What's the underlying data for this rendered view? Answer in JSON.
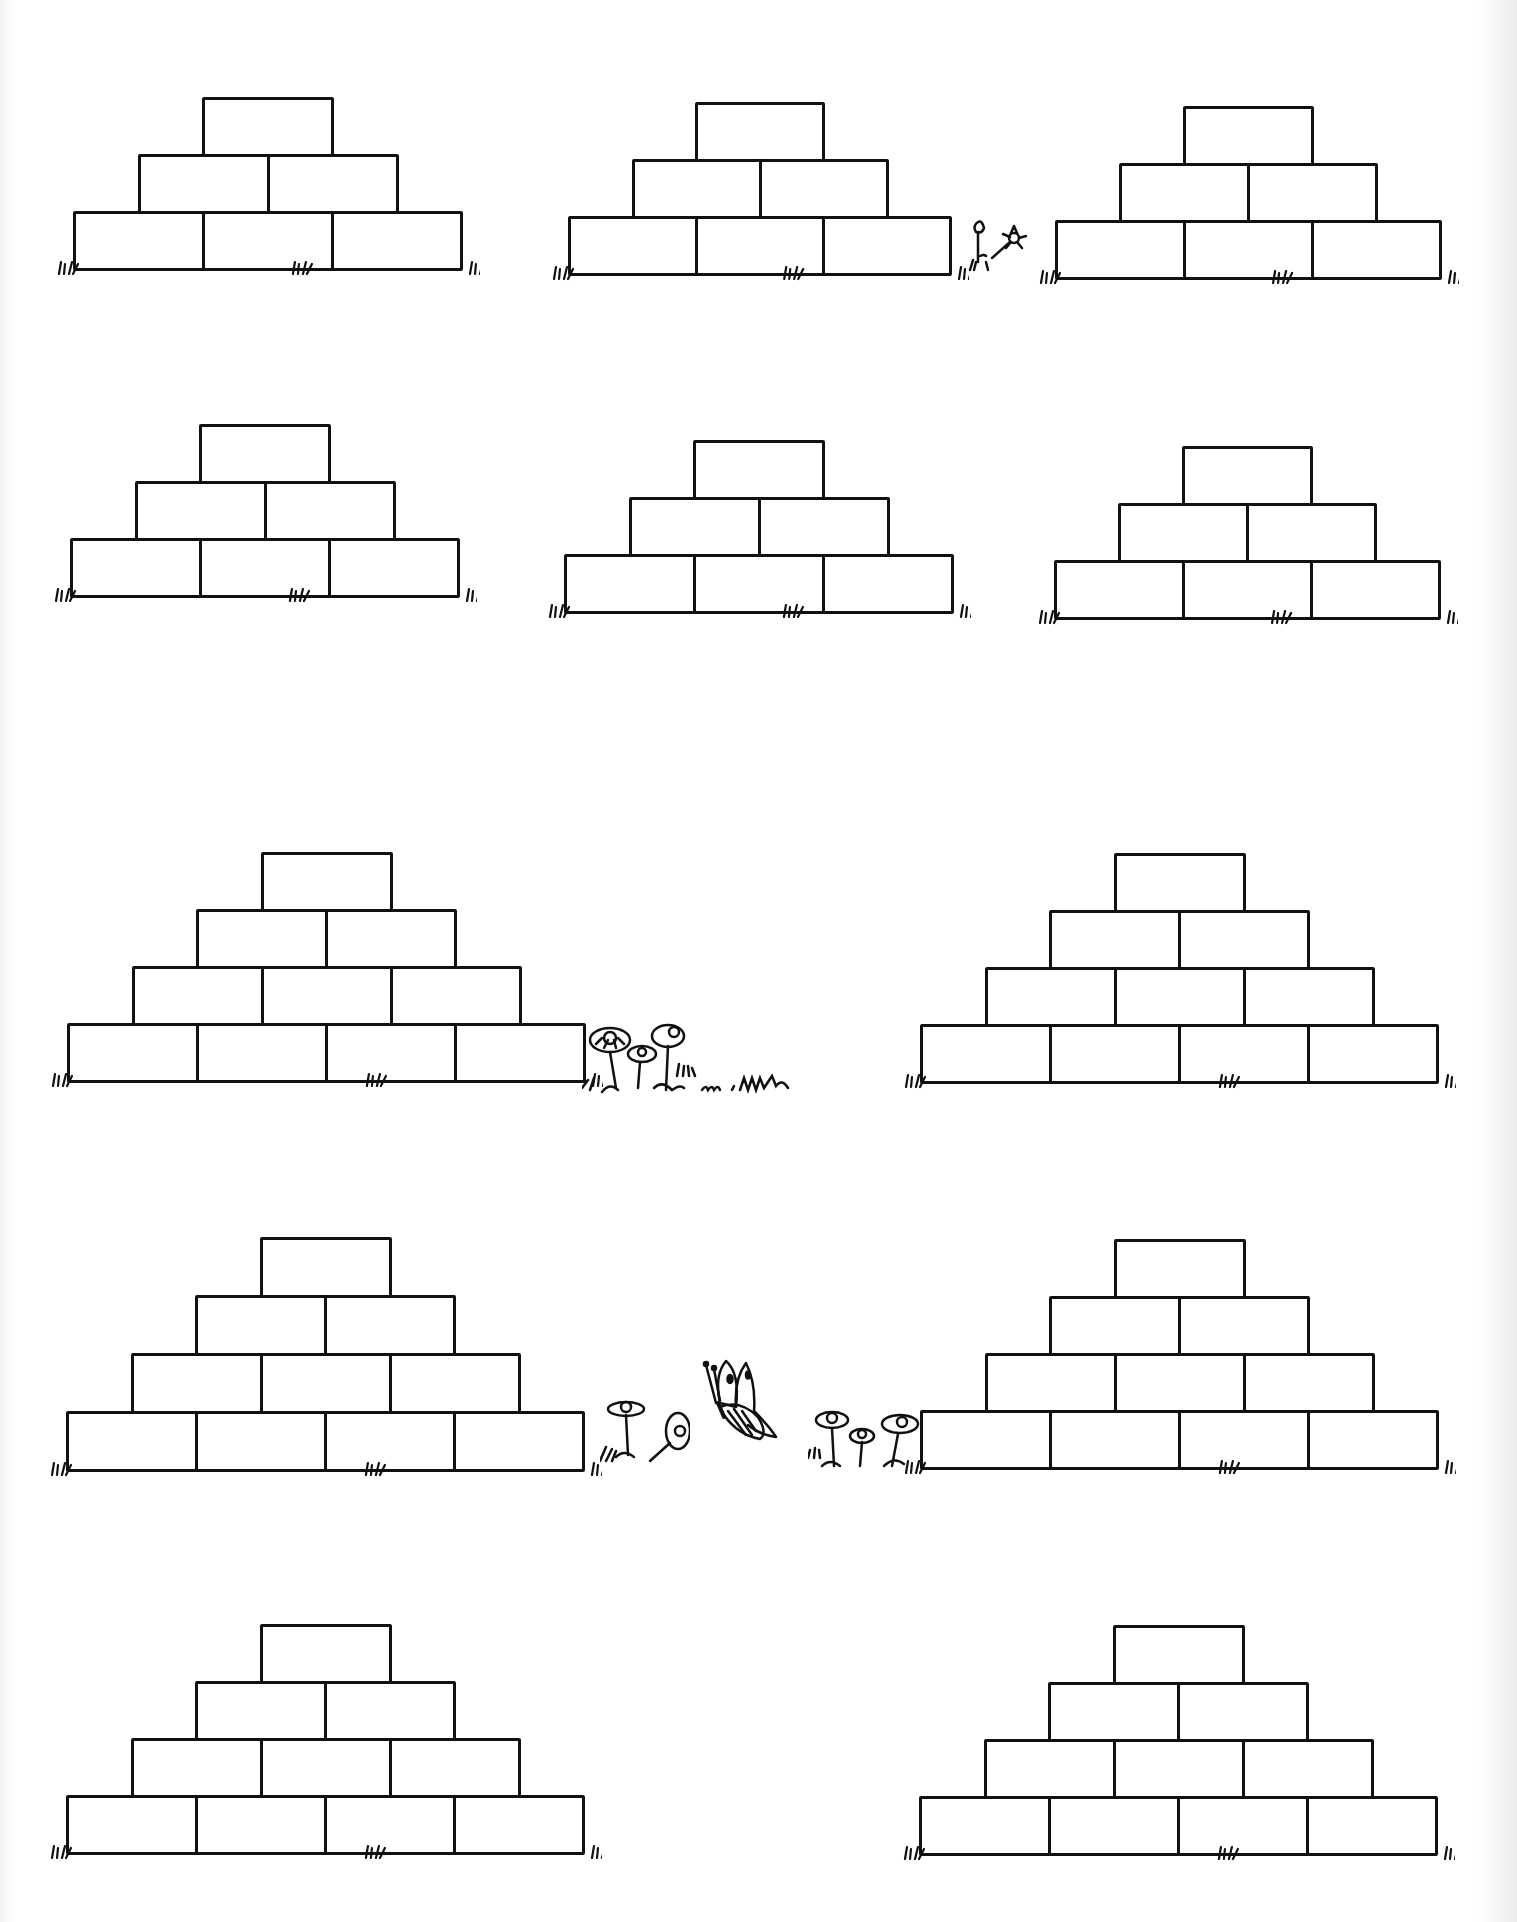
{
  "worksheet": {
    "ink_color": "#111111",
    "paper_color": "#ffffff",
    "pyramids": [
      {
        "id": "p1",
        "levels": 3,
        "left": 73,
        "top": 97,
        "brick_w": 129,
        "brick_h": 57
      },
      {
        "id": "p2",
        "levels": 3,
        "left": 568,
        "top": 102,
        "brick_w": 127,
        "brick_h": 57
      },
      {
        "id": "p3",
        "levels": 3,
        "left": 1055,
        "top": 106,
        "brick_w": 128,
        "brick_h": 57
      },
      {
        "id": "p4",
        "levels": 3,
        "left": 70,
        "top": 424,
        "brick_w": 129,
        "brick_h": 57
      },
      {
        "id": "p5",
        "levels": 3,
        "left": 564,
        "top": 440,
        "brick_w": 129,
        "brick_h": 57
      },
      {
        "id": "p6",
        "levels": 3,
        "left": 1054,
        "top": 446,
        "brick_w": 128,
        "brick_h": 57
      },
      {
        "id": "p7",
        "levels": 4,
        "left": 67,
        "top": 852,
        "brick_w": 129,
        "brick_h": 57
      },
      {
        "id": "p8",
        "levels": 4,
        "left": 920,
        "top": 853,
        "brick_w": 129,
        "brick_h": 57
      },
      {
        "id": "p9",
        "levels": 4,
        "left": 66,
        "top": 1237,
        "brick_w": 129,
        "brick_h": 58
      },
      {
        "id": "p10",
        "levels": 4,
        "left": 920,
        "top": 1239,
        "brick_w": 129,
        "brick_h": 57
      },
      {
        "id": "p11",
        "levels": 4,
        "left": 66,
        "top": 1624,
        "brick_w": 129,
        "brick_h": 57
      },
      {
        "id": "p12",
        "levels": 4,
        "left": 919,
        "top": 1625,
        "brick_w": 129,
        "brick_h": 57
      }
    ],
    "decorations": [
      {
        "type": "flower-icon",
        "count": 2,
        "near": "p2-right"
      },
      {
        "type": "flower-icon",
        "count": 3,
        "near": "p7-right"
      },
      {
        "type": "butterfly-icon",
        "count": 1,
        "near": "row4-center"
      },
      {
        "type": "flower-icon",
        "count": 4,
        "near": "row4-center"
      },
      {
        "type": "grass-icon",
        "count": "many",
        "near": "pyramid-bases"
      }
    ]
  }
}
